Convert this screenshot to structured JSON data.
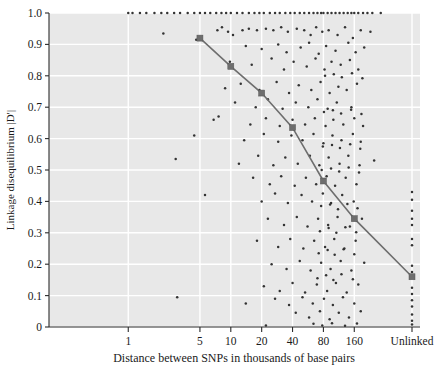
{
  "chart_data": {
    "type": "scatter",
    "title": "",
    "xlabel": "Distance between SNPs in thousands of base pairs",
    "ylabel": "Linkage disequilibrium |D′|",
    "xscale": "log-ordinal",
    "grid": true,
    "legend": null,
    "ylim": [
      0,
      1.0
    ],
    "ytick_labels": [
      "0",
      "0.1",
      "0.2",
      "0.3",
      "0.4",
      "0.5",
      "0.6",
      "0.7",
      "0.8",
      "0.9",
      "1.0"
    ],
    "ytick_values": [
      0,
      0.1,
      0.2,
      0.3,
      0.4,
      0.5,
      0.6,
      0.7,
      0.8,
      0.9,
      1.0
    ],
    "xtick_labels": [
      "1",
      "5",
      "10",
      "20",
      "40",
      "80",
      "160",
      "Unlinked"
    ],
    "xtick_positions": [
      1,
      5,
      10,
      20,
      40,
      80,
      160,
      400
    ],
    "series": [
      {
        "name": "Mean |D'| trend",
        "type": "line",
        "marker": "square",
        "color": "#6e6e6e",
        "x_labels": [
          "5",
          "10",
          "20",
          "40",
          "80",
          "160",
          "Unlinked"
        ],
        "values": [
          0.92,
          0.83,
          0.745,
          0.635,
          0.465,
          0.345,
          0.16
        ]
      },
      {
        "name": "Individual SNP pairs",
        "type": "scatter",
        "marker": "dot",
        "color": "#333333",
        "points": [
          [
            1.0,
            1.0
          ],
          [
            1.1,
            1.0
          ],
          [
            1.3,
            1.0
          ],
          [
            1.5,
            1.0
          ],
          [
            1.8,
            1.0
          ],
          [
            2.1,
            1.0
          ],
          [
            2.4,
            1.0
          ],
          [
            2.8,
            1.0
          ],
          [
            3.2,
            1.0
          ],
          [
            3.8,
            1.0
          ],
          [
            4.4,
            1.0
          ],
          [
            5.0,
            1.0
          ],
          [
            5.6,
            1.0
          ],
          [
            6.3,
            1.0
          ],
          [
            7.2,
            1.0
          ],
          [
            8.1,
            1.0
          ],
          [
            9.0,
            1.0
          ],
          [
            10.0,
            1.0
          ],
          [
            11.5,
            1.0
          ],
          [
            13.0,
            1.0
          ],
          [
            15.0,
            1.0
          ],
          [
            17.0,
            1.0
          ],
          [
            19.0,
            1.0
          ],
          [
            21.0,
            1.0
          ],
          [
            24.0,
            1.0
          ],
          [
            27.0,
            1.0
          ],
          [
            30.0,
            1.0
          ],
          [
            34.0,
            1.0
          ],
          [
            38.0,
            1.0
          ],
          [
            42.0,
            1.0
          ],
          [
            47.0,
            1.0
          ],
          [
            52.0,
            1.0
          ],
          [
            58.0,
            1.0
          ],
          [
            64.0,
            1.0
          ],
          [
            70.0,
            1.0
          ],
          [
            76.0,
            1.0
          ],
          [
            80.0,
            1.0
          ],
          [
            88.0,
            1.0
          ],
          [
            96.0,
            1.0
          ],
          [
            105.0,
            1.0
          ],
          [
            115.0,
            1.0
          ],
          [
            126.0,
            1.0
          ],
          [
            138.0,
            1.0
          ],
          [
            150.0,
            1.0
          ],
          [
            160.0,
            1.0
          ],
          [
            175.0,
            1.0
          ],
          [
            195.0,
            1.0
          ],
          [
            215.0,
            1.0
          ],
          [
            240.0,
            1.0
          ],
          [
            290.0,
            1.0
          ],
          [
            2.2,
            0.935
          ],
          [
            4.6,
            0.915
          ],
          [
            7.4,
            0.945
          ],
          [
            8.2,
            0.955
          ],
          [
            9.4,
            0.94
          ],
          [
            10.5,
            0.93
          ],
          [
            13.0,
            0.945
          ],
          [
            15.0,
            0.95
          ],
          [
            18.0,
            0.945
          ],
          [
            22.0,
            0.95
          ],
          [
            26.0,
            0.945
          ],
          [
            31.0,
            0.955
          ],
          [
            36.0,
            0.94
          ],
          [
            44.0,
            0.95
          ],
          [
            52.0,
            0.945
          ],
          [
            60.0,
            0.93
          ],
          [
            68.0,
            0.955
          ],
          [
            78.0,
            0.94
          ],
          [
            90.0,
            0.945
          ],
          [
            110.0,
            0.93
          ],
          [
            130.0,
            0.955
          ],
          [
            155.0,
            0.92
          ],
          [
            185.0,
            0.945
          ],
          [
            230.0,
            0.94
          ],
          [
            14.0,
            0.895
          ],
          [
            20.0,
            0.885
          ],
          [
            29.0,
            0.9
          ],
          [
            35.0,
            0.875
          ],
          [
            48.0,
            0.89
          ],
          [
            58.0,
            0.905
          ],
          [
            72.0,
            0.87
          ],
          [
            85.0,
            0.895
          ],
          [
            105.0,
            0.88
          ],
          [
            140.0,
            0.905
          ],
          [
            165.0,
            0.875
          ],
          [
            200.0,
            0.89
          ],
          [
            9.8,
            0.845
          ],
          [
            16.0,
            0.835
          ],
          [
            25.0,
            0.855
          ],
          [
            33.0,
            0.82
          ],
          [
            41.0,
            0.845
          ],
          [
            55.0,
            0.83
          ],
          [
            67.0,
            0.855
          ],
          [
            82.0,
            0.82
          ],
          [
            96.0,
            0.845
          ],
          [
            118.0,
            0.835
          ],
          [
            145.0,
            0.85
          ],
          [
            175.0,
            0.82
          ],
          [
            8.8,
            0.76
          ],
          [
            12.5,
            0.775
          ],
          [
            19.0,
            0.755
          ],
          [
            28.0,
            0.78
          ],
          [
            37.0,
            0.745
          ],
          [
            46.0,
            0.77
          ],
          [
            61.0,
            0.755
          ],
          [
            75.0,
            0.78
          ],
          [
            92.0,
            0.745
          ],
          [
            112.0,
            0.765
          ],
          [
            135.0,
            0.755
          ],
          [
            170.0,
            0.775
          ],
          [
            11.0,
            0.715
          ],
          [
            17.5,
            0.7
          ],
          [
            23.0,
            0.725
          ],
          [
            32.0,
            0.695
          ],
          [
            43.0,
            0.715
          ],
          [
            57.0,
            0.7
          ],
          [
            70.0,
            0.725
          ],
          [
            88.0,
            0.695
          ],
          [
            108.0,
            0.715
          ],
          [
            150.0,
            0.7
          ],
          [
            6.8,
            0.66
          ],
          [
            7.6,
            0.67
          ],
          [
            15.5,
            0.645
          ],
          [
            22.0,
            0.665
          ],
          [
            30.0,
            0.64
          ],
          [
            40.0,
            0.66
          ],
          [
            53.0,
            0.645
          ],
          [
            66.0,
            0.665
          ],
          [
            84.0,
            0.64
          ],
          [
            100.0,
            0.66
          ],
          [
            125.0,
            0.645
          ],
          [
            160.0,
            0.665
          ],
          [
            195.0,
            0.64
          ],
          [
            4.4,
            0.61
          ],
          [
            13.5,
            0.595
          ],
          [
            21.0,
            0.615
          ],
          [
            29.0,
            0.59
          ],
          [
            39.0,
            0.61
          ],
          [
            50.0,
            0.595
          ],
          [
            64.0,
            0.615
          ],
          [
            80.0,
            0.585
          ],
          [
            98.0,
            0.61
          ],
          [
            120.0,
            0.595
          ],
          [
            155.0,
            0.615
          ],
          [
            185.0,
            0.59
          ],
          [
            2.9,
            0.535
          ],
          [
            12.0,
            0.52
          ],
          [
            18.5,
            0.545
          ],
          [
            26.0,
            0.515
          ],
          [
            34.0,
            0.54
          ],
          [
            45.0,
            0.52
          ],
          [
            59.0,
            0.545
          ],
          [
            73.0,
            0.515
          ],
          [
            90.0,
            0.54
          ],
          [
            115.0,
            0.52
          ],
          [
            140.0,
            0.545
          ],
          [
            180.0,
            0.515
          ],
          [
            250.0,
            0.53
          ],
          [
            400.0,
            0.43
          ],
          [
            16.5,
            0.475
          ],
          [
            24.0,
            0.455
          ],
          [
            31.0,
            0.48
          ],
          [
            42.0,
            0.45
          ],
          [
            54.0,
            0.475
          ],
          [
            68.0,
            0.455
          ],
          [
            86.0,
            0.48
          ],
          [
            104.0,
            0.45
          ],
          [
            132.0,
            0.475
          ],
          [
            168.0,
            0.455
          ],
          [
            400.0,
            0.405
          ],
          [
            5.6,
            0.42
          ],
          [
            20.0,
            0.4
          ],
          [
            27.0,
            0.425
          ],
          [
            36.0,
            0.395
          ],
          [
            49.0,
            0.42
          ],
          [
            62.0,
            0.4
          ],
          [
            79.0,
            0.425
          ],
          [
            95.0,
            0.395
          ],
          [
            122.0,
            0.42
          ],
          [
            158.0,
            0.4
          ],
          [
            400.0,
            0.37
          ],
          [
            23.0,
            0.345
          ],
          [
            33.0,
            0.325
          ],
          [
            44.0,
            0.35
          ],
          [
            56.0,
            0.32
          ],
          [
            71.0,
            0.345
          ],
          [
            89.0,
            0.325
          ],
          [
            110.0,
            0.35
          ],
          [
            145.0,
            0.32
          ],
          [
            190.0,
            0.345
          ],
          [
            400.0,
            0.345
          ],
          [
            400.0,
            0.325
          ],
          [
            18.0,
            0.275
          ],
          [
            29.0,
            0.255
          ],
          [
            38.0,
            0.28
          ],
          [
            51.0,
            0.25
          ],
          [
            65.0,
            0.275
          ],
          [
            83.0,
            0.255
          ],
          [
            102.0,
            0.28
          ],
          [
            128.0,
            0.25
          ],
          [
            165.0,
            0.275
          ],
          [
            400.0,
            0.28
          ],
          [
            400.0,
            0.26
          ],
          [
            25.0,
            0.2
          ],
          [
            35.0,
            0.185
          ],
          [
            47.0,
            0.21
          ],
          [
            60.0,
            0.18
          ],
          [
            76.0,
            0.205
          ],
          [
            94.0,
            0.185
          ],
          [
            118.0,
            0.21
          ],
          [
            150.0,
            0.18
          ],
          [
            200.0,
            0.205
          ],
          [
            400.0,
            0.195
          ],
          [
            400.0,
            0.175
          ],
          [
            21.0,
            0.13
          ],
          [
            30.0,
            0.115
          ],
          [
            40.0,
            0.14
          ],
          [
            53.0,
            0.11
          ],
          [
            69.0,
            0.135
          ],
          [
            87.0,
            0.115
          ],
          [
            106.0,
            0.14
          ],
          [
            135.0,
            0.11
          ],
          [
            175.0,
            0.135
          ],
          [
            400.0,
            0.125
          ],
          [
            400.0,
            0.105
          ],
          [
            3.0,
            0.095
          ],
          [
            14.0,
            0.075
          ],
          [
            27.0,
            0.09
          ],
          [
            37.0,
            0.07
          ],
          [
            50.0,
            0.095
          ],
          [
            63.0,
            0.075
          ],
          [
            81.0,
            0.09
          ],
          [
            99.0,
            0.07
          ],
          [
            124.0,
            0.095
          ],
          [
            160.0,
            0.075
          ],
          [
            400.0,
            0.085
          ],
          [
            400.0,
            0.065
          ],
          [
            43.0,
            0.045
          ],
          [
            58.0,
            0.03
          ],
          [
            74.0,
            0.05
          ],
          [
            92.0,
            0.025
          ],
          [
            113.0,
            0.045
          ],
          [
            142.0,
            0.03
          ],
          [
            185.0,
            0.05
          ],
          [
            400.0,
            0.04
          ],
          [
            400.0,
            0.02
          ],
          [
            64.0,
            0.01
          ],
          [
            78.0,
            0.005
          ],
          [
            97.0,
            0.012
          ],
          [
            130.0,
            0.004
          ],
          [
            170.0,
            0.011
          ],
          [
            22.0,
            0.005
          ],
          [
            400.0,
            0.008
          ],
          [
            70.0,
            0.155
          ],
          [
            85.0,
            0.165
          ],
          [
            100.0,
            0.15
          ],
          [
            120.0,
            0.168
          ],
          [
            155.0,
            0.152
          ],
          [
            72.0,
            0.235
          ],
          [
            88.0,
            0.245
          ],
          [
            103.0,
            0.23
          ],
          [
            126.0,
            0.248
          ],
          [
            160.0,
            0.232
          ],
          [
            74.0,
            0.305
          ],
          [
            90.0,
            0.315
          ],
          [
            107.0,
            0.3
          ],
          [
            131.0,
            0.318
          ],
          [
            167.0,
            0.302
          ],
          [
            76.0,
            0.385
          ],
          [
            93.0,
            0.39
          ],
          [
            111.0,
            0.375
          ],
          [
            137.0,
            0.392
          ],
          [
            172.0,
            0.378
          ],
          [
            77.0,
            0.5
          ],
          [
            95.0,
            0.505
          ],
          [
            114.0,
            0.495
          ],
          [
            141.0,
            0.508
          ],
          [
            178.0,
            0.492
          ],
          [
            79.0,
            0.575
          ],
          [
            97.0,
            0.58
          ],
          [
            116.0,
            0.57
          ],
          [
            146.0,
            0.582
          ],
          [
            183.0,
            0.568
          ],
          [
            81.0,
            0.685
          ],
          [
            99.0,
            0.69
          ],
          [
            119.0,
            0.68
          ],
          [
            149.0,
            0.692
          ],
          [
            188.0,
            0.678
          ],
          [
            83.0,
            0.8
          ],
          [
            101.0,
            0.805
          ],
          [
            121.0,
            0.795
          ],
          [
            152.0,
            0.808
          ],
          [
            192.0,
            0.792
          ]
        ]
      }
    ]
  },
  "axes": {
    "plot_bg_color": "#e8e8e8",
    "grid_color": "#ffffff",
    "axis_color": "#2b2b2b",
    "trend_color": "#6e6e6e",
    "point_color": "#2e2e2e"
  }
}
